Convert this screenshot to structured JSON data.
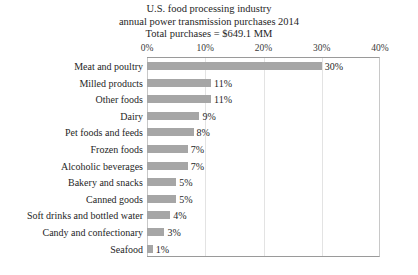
{
  "chart_data": {
    "type": "bar",
    "orientation": "horizontal",
    "title": "U.S. food processing industry\nannual power transmission purchases 2014\nTotal purchases = $649.1 MM",
    "title_lines": [
      "U.S. food processing industry",
      "annual power transmission purchases 2014",
      "Total purchases = $649.1 MM"
    ],
    "xlabel": "",
    "ylabel": "",
    "xlim": [
      0,
      40
    ],
    "xticks": [
      0,
      10,
      20,
      30,
      40
    ],
    "xtick_labels": [
      "0%",
      "10%",
      "20%",
      "30%",
      "40%"
    ],
    "grid": "vertical",
    "legend": "none",
    "bar_color": "#a6a6a6",
    "categories": [
      "Meat and poultry",
      "Milled products",
      "Other foods",
      "Dairy",
      "Pet foods and feeds",
      "Frozen foods",
      "Alcoholic beverages",
      "Bakery and snacks",
      "Canned goods",
      "Soft drinks and bottled water",
      "Candy and confectionary",
      "Seafood"
    ],
    "values": [
      30,
      11,
      11,
      9,
      8,
      7,
      7,
      5,
      5,
      4,
      3,
      1
    ],
    "data_labels": [
      "30%",
      "11%",
      "11%",
      "9%",
      "8%",
      "7%",
      "7%",
      "5%",
      "5%",
      "4%",
      "3%",
      "1%"
    ]
  }
}
